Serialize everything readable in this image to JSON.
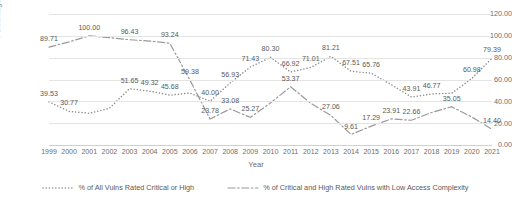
{
  "chart_data": {
    "type": "line",
    "title": "",
    "xlabel": "Year",
    "ylabel": "Percentage of Total",
    "ylim": [
      0,
      120
    ],
    "ytick_step": 20,
    "ytick_labels": [
      "0.00",
      "20.00",
      "40.00",
      "60.00",
      "80.00",
      "100.00",
      "120.00"
    ],
    "grid": true,
    "legend_position": "bottom",
    "categories": [
      "1999",
      "2000",
      "2001",
      "2002",
      "2003",
      "2004",
      "2005",
      "2006",
      "2007",
      "2008",
      "2009",
      "2010",
      "2011",
      "2012",
      "2013",
      "2014",
      "2015",
      "2016",
      "2017",
      "2018",
      "2019",
      "2020",
      "2021"
    ],
    "series": [
      {
        "name": "% of All Vulns Rated Critical or High",
        "style": "dotted",
        "color": "#8c8c8c",
        "values": [
          39.53,
          30.77,
          29.1,
          33.6,
          51.65,
          49.32,
          45.68,
          47.6,
          40.0,
          56.93,
          71.43,
          80.3,
          66.92,
          71.01,
          81.21,
          67.51,
          65.76,
          55.3,
          43.91,
          46.77,
          47.4,
          60.98,
          79.39
        ],
        "labels": [
          {
            "year": "1999",
            "text": "39.53"
          },
          {
            "year": "2000",
            "text": "30.77"
          },
          {
            "year": "2003",
            "text": "51.65"
          },
          {
            "year": "2004",
            "text": "49.32"
          },
          {
            "year": "2005",
            "text": "45.68"
          },
          {
            "year": "2007",
            "text": "40.00"
          },
          {
            "year": "2008",
            "text": "56.93"
          },
          {
            "year": "2009",
            "text": "71.43"
          },
          {
            "year": "2010",
            "text": "80.30"
          },
          {
            "year": "2011",
            "text": "66.92"
          },
          {
            "year": "2012",
            "text": "71.01"
          },
          {
            "year": "2013",
            "text": "81.21"
          },
          {
            "year": "2014",
            "text": "67.51"
          },
          {
            "year": "2015",
            "text": "65.76"
          },
          {
            "year": "2017",
            "text": "43.91"
          },
          {
            "year": "2018",
            "text": "46.77"
          },
          {
            "year": "2020",
            "text": "60.98"
          },
          {
            "year": "2021",
            "text": "79.39"
          }
        ]
      },
      {
        "name": "% of Critical and High Rated Vulns with Low Access Complexity",
        "style": "dash-dot",
        "color": "#9a9a9a",
        "values": [
          89.71,
          94.5,
          100.0,
          98.3,
          96.43,
          95.2,
          93.24,
          59.38,
          23.78,
          33.08,
          25.27,
          38.6,
          53.37,
          38.2,
          27.06,
          9.61,
          17.29,
          23.91,
          22.66,
          29.8,
          35.05,
          25.6,
          14.4
        ],
        "labels": [
          {
            "year": "1999",
            "text": "89.71"
          },
          {
            "year": "2001",
            "text": "100.00"
          },
          {
            "year": "2003",
            "text": "96.43"
          },
          {
            "year": "2005",
            "text": "93.24"
          },
          {
            "year": "2006",
            "text": "59.38"
          },
          {
            "year": "2007",
            "text": "23.78"
          },
          {
            "year": "2008",
            "text": "33.08"
          },
          {
            "year": "2009",
            "text": "25.27"
          },
          {
            "year": "2011",
            "text": "53.37"
          },
          {
            "year": "2013",
            "text": "27.06"
          },
          {
            "year": "2014",
            "text": "9.61"
          },
          {
            "year": "2015",
            "text": "17.29"
          },
          {
            "year": "2016",
            "text": "23.91"
          },
          {
            "year": "2017",
            "text": "22.66"
          },
          {
            "year": "2019",
            "text": "35.05"
          },
          {
            "year": "2021",
            "text": "14.40"
          }
        ]
      }
    ]
  },
  "legend": {
    "items": [
      {
        "label": "% of All Vulns Rated Critical or High"
      },
      {
        "label": "% of Critical and High Rated Vulns with Low Access Complexity"
      }
    ]
  }
}
